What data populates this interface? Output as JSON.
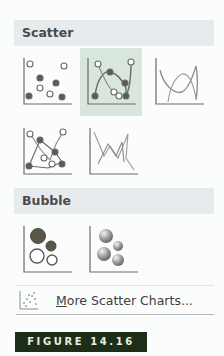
{
  "sections": [
    {
      "title": "Scatter",
      "charts": [
        {
          "name": "Scatter",
          "icon": "scatter-markers-icon",
          "selected": false
        },
        {
          "name": "Scatter with Smooth Lines and Markers",
          "icon": "scatter-smooth-markers-icon",
          "selected": true
        },
        {
          "name": "Scatter with Smooth Lines",
          "icon": "scatter-smooth-lines-icon",
          "selected": false
        },
        {
          "name": "Scatter with Straight Lines and Markers",
          "icon": "scatter-straight-markers-icon",
          "selected": false
        },
        {
          "name": "Scatter with Straight Lines",
          "icon": "scatter-straight-lines-icon",
          "selected": false
        }
      ]
    },
    {
      "title": "Bubble",
      "charts": [
        {
          "name": "Bubble",
          "icon": "bubble-icon",
          "selected": false
        },
        {
          "name": "3-D Bubble",
          "icon": "bubble-3d-icon",
          "selected": false
        }
      ]
    }
  ],
  "more_link": {
    "accel": "M",
    "rest": "ore Scatter Charts...",
    "icon": "more-scatter-charts-icon"
  },
  "figure_label": "FIGURE 14.16",
  "colors": {
    "header_bg": "#e6ecee",
    "selected_bg": "#d9e6dc",
    "figure_bg": "#1e2d18",
    "marker_dark": "#5a5a5a"
  }
}
